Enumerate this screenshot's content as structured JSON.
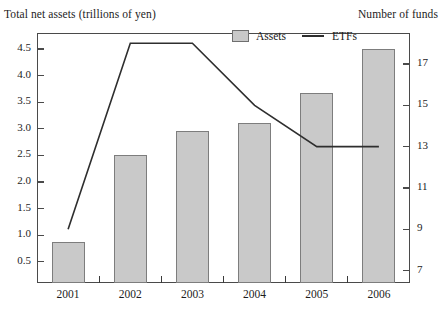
{
  "titles": {
    "left_axis": "Total net assets (trillions of yen)",
    "right_axis": "Number of funds"
  },
  "legend": {
    "assets_label": "Assets",
    "etfs_label": "ETFs",
    "swatch_color": "#c9c9c9",
    "line_color": "#2e2e2e"
  },
  "chart_data": {
    "type": "bar",
    "title": "",
    "xlabel": "",
    "ylabel": "Total net assets (trillions of yen)",
    "y2label": "Number of funds",
    "categories": [
      "2001",
      "2002",
      "2003",
      "2004",
      "2005",
      "2006"
    ],
    "grid": false,
    "legend_position": "top-center",
    "ylim": [
      0.1,
      4.8
    ],
    "y2lim": [
      6.4,
      18.5
    ],
    "yticks": [
      "0.5",
      "1.0",
      "1.5",
      "2.0",
      "2.5",
      "3.0",
      "3.5",
      "4.0",
      "4.5"
    ],
    "ytick_values": [
      0.5,
      1.0,
      1.5,
      2.0,
      2.5,
      3.0,
      3.5,
      4.0,
      4.5
    ],
    "y2ticks": [
      "7",
      "9",
      "11",
      "13",
      "15",
      "17"
    ],
    "y2tick_values": [
      7,
      9,
      11,
      13,
      15,
      17
    ],
    "series": [
      {
        "name": "Assets",
        "type": "bar",
        "axis": "left",
        "color": "#c9c9c9",
        "values": [
          0.87,
          2.5,
          2.95,
          3.1,
          3.67,
          4.5
        ]
      },
      {
        "name": "ETFs",
        "type": "line",
        "axis": "right",
        "color": "#2e2e2e",
        "values": [
          9.0,
          18.0,
          18.0,
          15.0,
          13.0,
          13.0
        ]
      }
    ]
  }
}
